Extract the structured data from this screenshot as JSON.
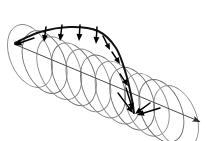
{
  "figure": {
    "type": "scientific-diagram",
    "background_color": "#ffffff",
    "width": 218,
    "height": 141
  },
  "colors": {
    "coil_line": "#6d6d6d",
    "coil_line_light": "#8a8a8a",
    "envelope_curve": "#111111",
    "arrow": "#000000",
    "axis": "#4a4a4a",
    "background": "#ffffff"
  },
  "axis": {
    "name": "propagation-axis",
    "start": [
      14,
      44
    ],
    "end": [
      203,
      123
    ],
    "arrowhead": "triangle",
    "stroke_width": 1.0,
    "label": ""
  },
  "helix": {
    "name": "helix-coil",
    "turns": 11,
    "start_center": [
      30,
      56
    ],
    "end_center": [
      176,
      117
    ],
    "radius_x": 20,
    "radius_y": 33,
    "tilt_degrees": -23,
    "stroke_width": 0.9,
    "description": "Stack of overlapping tilted ellipses forming a cylindrical helical coil from upper-left to lower-right"
  },
  "envelope": {
    "name": "envelope-curve",
    "description": "Bold black curve tracing the front edge of the helical wave, arcing over the top then plunging down to the focus point",
    "stroke_width": 2.0,
    "path_points": [
      [
        15,
        43
      ],
      [
        40,
        32
      ],
      [
        70,
        27
      ],
      [
        98,
        31
      ],
      [
        116,
        48
      ],
      [
        126,
        74
      ],
      [
        132,
        100
      ],
      [
        134,
        113
      ]
    ]
  },
  "arrows": {
    "name": "field-vector-arrows",
    "count": 12,
    "description": "Transverse field vectors drawn from the envelope curve toward the helix axis; they shorten and rotate as the wave advances, converging at a node",
    "items": [
      {
        "id": "arrow-1",
        "from": [
          34,
          38
        ],
        "to": [
          14,
          45
        ],
        "size": 7.5
      },
      {
        "id": "arrow-2",
        "from": [
          46,
          27
        ],
        "to": [
          44,
          42
        ],
        "size": 7.0
      },
      {
        "id": "arrow-3",
        "from": [
          62,
          25
        ],
        "to": [
          60,
          41
        ],
        "size": 7.0
      },
      {
        "id": "arrow-4",
        "from": [
          80,
          25
        ],
        "to": [
          79,
          41
        ],
        "size": 7.0
      },
      {
        "id": "arrow-5",
        "from": [
          97,
          27
        ],
        "to": [
          96,
          44
        ],
        "size": 7.0
      },
      {
        "id": "arrow-6",
        "from": [
          103,
          36
        ],
        "to": [
          110,
          50
        ],
        "size": 6.5
      },
      {
        "id": "arrow-7",
        "from": [
          112,
          52
        ],
        "to": [
          120,
          64
        ],
        "size": 6.5
      },
      {
        "id": "arrow-8",
        "from": [
          120,
          74
        ],
        "to": [
          128,
          86
        ],
        "size": 6.5
      },
      {
        "id": "arrow-9",
        "from": [
          126,
          88
        ],
        "to": [
          133,
          110
        ],
        "size": 7.0
      },
      {
        "id": "arrow-10",
        "from": [
          118,
          93
        ],
        "to": [
          133,
          113
        ],
        "size": 7.0
      },
      {
        "id": "arrow-11",
        "from": [
          150,
          103
        ],
        "to": [
          135,
          114
        ],
        "size": 7.0
      },
      {
        "id": "arrow-12",
        "from": [
          160,
          108
        ],
        "to": [
          137,
          115
        ],
        "size": 7.0
      }
    ],
    "focus_point": [
      134,
      113
    ]
  }
}
